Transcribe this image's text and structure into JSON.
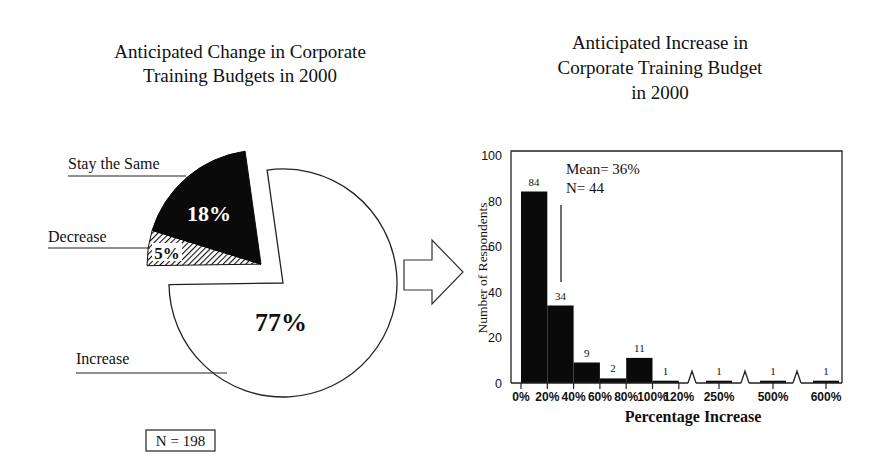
{
  "chart_data": [
    {
      "type": "pie",
      "title": "Anticipated Change in Corporate Training Budgets in 2000",
      "title_lines": [
        "Anticipated Change in Corporate",
        "Training Budgets in 2000"
      ],
      "slices": [
        {
          "label": "Increase",
          "value": 77,
          "value_label": "77%",
          "fill": "white",
          "exploded": false
        },
        {
          "label": "Decrease",
          "value": 5,
          "value_label": "5%",
          "fill": "hatched",
          "exploded": true
        },
        {
          "label": "Stay the Same",
          "value": 18,
          "value_label": "18%",
          "fill": "black",
          "exploded": true
        }
      ],
      "note": "N = 198"
    },
    {
      "type": "bar",
      "title": "Anticipated Increase in Corporate Training Budget in 2000",
      "title_lines": [
        "Anticipated Increase in",
        "Corporate Training Budget",
        "in 2000"
      ],
      "xlabel": "Percentage Increase",
      "ylabel": "Number of Respondents",
      "ylim": [
        0,
        100
      ],
      "yticks": [
        0,
        20,
        40,
        60,
        80,
        100
      ],
      "xtick_labels": [
        "0%",
        "20%",
        "40%",
        "60%",
        "80%",
        "100%",
        "120%",
        "250%",
        "500%",
        "600%"
      ],
      "bins": [
        {
          "range": "0-20%",
          "value": 84
        },
        {
          "range": "20-40%",
          "value": 34
        },
        {
          "range": "40-60%",
          "value": 9
        },
        {
          "range": "60-80%",
          "value": 2
        },
        {
          "range": "80-100%",
          "value": 11
        },
        {
          "range": "100-120%",
          "value": 1
        },
        {
          "range": "250%",
          "value": 1
        },
        {
          "range": "500%",
          "value": 1
        },
        {
          "range": "600%",
          "value": 1
        }
      ],
      "axis_breaks": [
        "120%-250%",
        "250%-500%",
        "500%-600%"
      ],
      "annotations": {
        "mean_label": "Mean= 36%",
        "n_label": "N= 44",
        "mean_value": 36
      }
    }
  ],
  "arrow": {
    "direction": "right",
    "meaning": "pie increase slice expands into histogram"
  }
}
